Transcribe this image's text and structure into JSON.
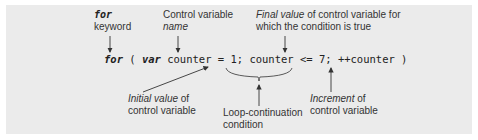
{
  "diagram": {
    "code_line": {
      "keyword_for": "for",
      "open": " ( ",
      "keyword_var": "var",
      "rest": " counter = 1; counter <= 7; ++counter )"
    },
    "annotations": {
      "for_keyword": {
        "line1": "for",
        "line2": "keyword"
      },
      "control_variable_name": {
        "line1": "Control variable",
        "line2": "name"
      },
      "final_value": {
        "line1_italic": "Final value",
        "line1_rest": " of control variable for",
        "line2": "which the condition is true"
      },
      "initial_value": {
        "line1_italic": "Initial value",
        "line1_rest": " of",
        "line2": "control variable"
      },
      "loop_continuation": {
        "line1": "Loop-continuation",
        "line2": "condition"
      },
      "increment": {
        "line1_italic": "Increment",
        "line1_rest": " of",
        "line2": "control variable"
      }
    },
    "colors": {
      "panel_bg": "#ebebeb",
      "text": "#333333",
      "arrow": "#333333"
    }
  }
}
